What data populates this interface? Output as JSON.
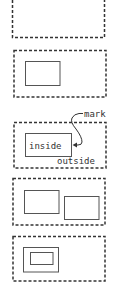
{
  "colors": {
    "stroke": "#444444",
    "dashed_stroke": "#333333",
    "background": "#ffffff"
  },
  "panels": [
    {
      "id": "panel-1",
      "description": "empty outer dashed box"
    },
    {
      "id": "panel-2",
      "description": "outer dashed box with one inner rectangle"
    },
    {
      "id": "panel-3",
      "description": "outer dashed box with labeled inner rectangle and pointer",
      "labels": {
        "inner": "inside",
        "outer": "outside",
        "pointer": "mark"
      }
    },
    {
      "id": "panel-4",
      "description": "outer dashed box with two overlapping-offset inner rectangles"
    },
    {
      "id": "panel-5",
      "description": "outer dashed box with nested rectangles"
    }
  ]
}
